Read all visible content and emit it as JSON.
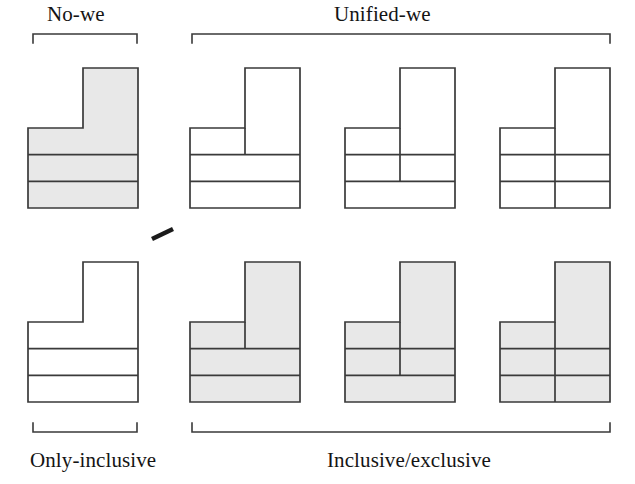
{
  "figure": {
    "title_top_left": "No-we",
    "title_top_right": "Unified-we",
    "title_bottom_left": "Only-inclusive",
    "title_bottom_right": "Inclusive/exclusive",
    "background_color": "#ffffff",
    "stroke_color": "#3a3a3a",
    "shade_color": "#e8e8e8",
    "rows": 2,
    "columns": 4,
    "separator_mark": "diagonal-tick"
  },
  "brackets": {
    "top_left": {
      "label": "No-we",
      "x1": 33,
      "x2": 137,
      "y": 34
    },
    "top_right": {
      "label": "Unified-we",
      "x1": 192,
      "x2": 610,
      "y": 34
    },
    "bottom_left": {
      "label": "Only-inclusive",
      "x1": 33,
      "x2": 137,
      "y": 432
    },
    "bottom_right": {
      "label": "Inclusive/exclusive",
      "x1": 192,
      "x2": 610,
      "y": 432
    }
  },
  "shapes": [
    {
      "id": "r1c1",
      "row": 1,
      "column": 1,
      "group": "No-we",
      "sub_group": "Top",
      "shaded": true,
      "divider_depth": 0,
      "divider_description": "no vertical division",
      "bands": 3,
      "x": 28,
      "y": 68,
      "width": 110,
      "height": 140,
      "stem_x": 83,
      "stem_width": 55,
      "stem_top": 68,
      "base_top": 128
    },
    {
      "id": "r1c2",
      "row": 1,
      "column": 2,
      "group": "Unified-we",
      "sub_group": "Top",
      "shaded": false,
      "divider_depth": 1,
      "divider_description": "vertical line through top band only",
      "bands": 3,
      "x": 190,
      "y": 68,
      "width": 110,
      "height": 140,
      "stem_x": 245,
      "stem_width": 55,
      "stem_top": 68,
      "base_top": 128
    },
    {
      "id": "r1c3",
      "row": 1,
      "column": 3,
      "group": "Unified-we",
      "sub_group": "Top",
      "shaded": false,
      "divider_depth": 2,
      "divider_description": "vertical line through top and middle bands",
      "bands": 3,
      "x": 345,
      "y": 68,
      "width": 110,
      "height": 140,
      "stem_x": 400,
      "stem_width": 55,
      "stem_top": 68,
      "base_top": 128
    },
    {
      "id": "r1c4",
      "row": 1,
      "column": 4,
      "group": "Unified-we",
      "sub_group": "Top",
      "shaded": false,
      "divider_depth": 3,
      "divider_description": "vertical line through all three bands",
      "bands": 3,
      "x": 500,
      "y": 68,
      "width": 110,
      "height": 140,
      "stem_x": 555,
      "stem_width": 55,
      "stem_top": 68,
      "base_top": 128
    },
    {
      "id": "r2c1",
      "row": 2,
      "column": 1,
      "group": "Only-inclusive",
      "sub_group": "Bottom",
      "shaded": false,
      "divider_depth": 0,
      "divider_description": "no vertical division",
      "bands": 3,
      "x": 28,
      "y": 262,
      "width": 110,
      "height": 140,
      "stem_x": 83,
      "stem_width": 55,
      "stem_top": 262,
      "base_top": 322
    },
    {
      "id": "r2c2",
      "row": 2,
      "column": 2,
      "group": "Inclusive/exclusive",
      "sub_group": "Bottom",
      "shaded": true,
      "divider_depth": 1,
      "divider_description": "vertical line through top band only",
      "bands": 3,
      "x": 190,
      "y": 262,
      "width": 110,
      "height": 140,
      "stem_x": 245,
      "stem_width": 55,
      "stem_top": 262,
      "base_top": 322
    },
    {
      "id": "r2c3",
      "row": 2,
      "column": 3,
      "group": "Inclusive/exclusive",
      "sub_group": "Bottom",
      "shaded": true,
      "divider_depth": 2,
      "divider_description": "vertical line through top and middle bands",
      "bands": 3,
      "x": 345,
      "y": 262,
      "width": 110,
      "height": 140,
      "stem_x": 400,
      "stem_width": 55,
      "stem_top": 262,
      "base_top": 322
    },
    {
      "id": "r2c4",
      "row": 2,
      "column": 4,
      "group": "Inclusive/exclusive",
      "sub_group": "Bottom",
      "shaded": true,
      "divider_depth": 3,
      "divider_description": "vertical line through all three bands",
      "bands": 3,
      "x": 500,
      "y": 262,
      "width": 110,
      "height": 140,
      "stem_x": 555,
      "stem_width": 55,
      "stem_top": 262,
      "base_top": 322
    }
  ]
}
